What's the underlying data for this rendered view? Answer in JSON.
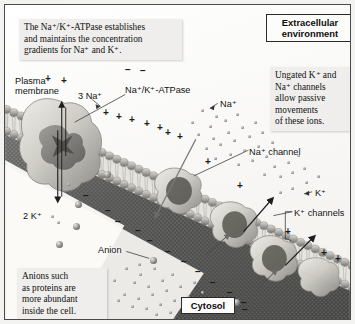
{
  "figure": {
    "background_color": "#fbfbfa",
    "border_color": "#4a4a4a"
  },
  "callouts": {
    "pump": {
      "line1": "The Na⁺/K⁺-ATPase establishes",
      "line2": "and maintains the concentration",
      "line3": "gradients for Na⁺ and K⁺."
    },
    "ungated": {
      "line1": "Ungated K⁺ and",
      "line2": "Na⁺ channels",
      "line3": "allow passive",
      "line4": "movements",
      "line5": "of these ions."
    },
    "anions": {
      "line1": "Anions such",
      "line2": "as proteins are",
      "line3": "more abundant",
      "line4": "inside the cell."
    }
  },
  "compartments": {
    "extracellular_line1": "Extracellular",
    "extracellular_line2": "environment",
    "cytosol": "Cytosol"
  },
  "labels": {
    "plasma_line1": "Plasma",
    "plasma_line2": "membrane",
    "three_sodium": "3 Na⁺",
    "atpase": "Na⁺/K⁺-ATPase",
    "sodium_ion": "Na⁺",
    "sodium_channel": "Na⁺ channel",
    "potassium_ion": "K⁺",
    "potassium_channels": "K⁺ channels",
    "two_potassium": "2 K⁺",
    "anion": "Anion"
  },
  "charges": {
    "positive_symbol": "+",
    "negative_symbol": "−",
    "outer_leaflet_count": 14,
    "inner_leaflet_count": 12
  },
  "colors": {
    "membrane_head": "#9a9a98",
    "membrane_tail": "#d8d7d2",
    "protein_light": "#dedcd6",
    "protein_dark": "#6f6e6b",
    "cytosol_dark": "#3e3e3e",
    "ion_gray": "#8c8c8a",
    "text": "#0f0f0f"
  }
}
